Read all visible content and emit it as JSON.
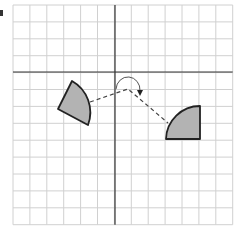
{
  "diagram": {
    "grid": {
      "left": 13,
      "top": 5,
      "cell": 16.9,
      "cols": 13,
      "rows": 13,
      "line_color": "#d0d0d0",
      "axis_color": "#333333",
      "axis_x_pixel": 115,
      "axis_y_pixel": 72
    },
    "shapes": [
      {
        "name": "original-sector",
        "fill": "#b3b3b3",
        "stroke": "#222222",
        "path": "M72,81 L58,109 L88,125 A36,36 0 0 0 72,81 Z"
      },
      {
        "name": "rotated-sector",
        "fill": "#b3b3b3",
        "stroke": "#222222",
        "path": "M166,139 L200,139 L200,106 A34,34 0 0 0 166,139 Z"
      }
    ],
    "construction": {
      "dashed_path": "M90,102 L128,89 L168,123",
      "rotation_center": [
        128,
        89
      ],
      "rotation_arc": "M116,89 A12,13 0 1 1 140,91",
      "arrowhead": "M137,90 L143,90 L140,96 Z"
    }
  }
}
